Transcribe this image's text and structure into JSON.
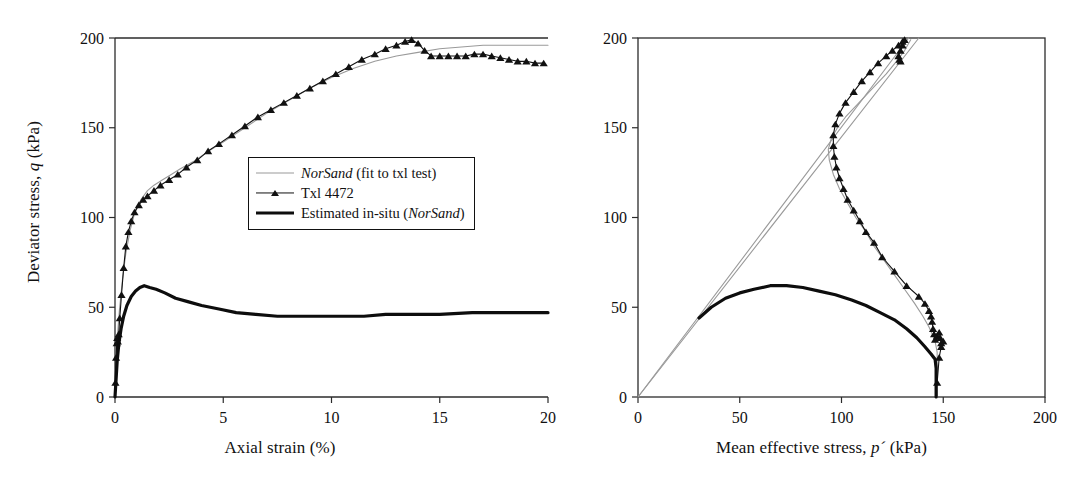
{
  "figure": {
    "panels": [
      {
        "id": "left",
        "ylabel_main": "Deviator stress,",
        "ylabel_sym": "q",
        "ylabel_unit": "(kPa)",
        "xlabel": "Axial strain (%)"
      },
      {
        "id": "right",
        "xlabel_main": "Mean effective stress,",
        "xlabel_sym": "p´",
        "xlabel_unit": "(kPa)"
      }
    ]
  },
  "legend": {
    "position": "center-right of left panel",
    "items": [
      {
        "label": "NorSand (fit to txl test)",
        "emph": "NorSand",
        "rest": " (fit to txl test)",
        "style": "thin-grey-line",
        "color": "#9a9a9a"
      },
      {
        "label": "Txl 4472",
        "emph": "",
        "rest": "Txl 4472",
        "style": "line-with-triangle-markers",
        "color": "#111111"
      },
      {
        "label": "Estimated in-situ (NorSand)",
        "emph": "",
        "rest": "Estimated in-situ (",
        "emph2": "NorSand",
        "rest2": ")",
        "style": "thick-black-line",
        "color": "#0d0d0d"
      }
    ]
  },
  "chart_data": [
    {
      "type": "line",
      "id": "stress-strain",
      "title": "",
      "xlabel": "Axial strain (%)",
      "ylabel": "Deviator stress, q (kPa)",
      "xlim": [
        0,
        20
      ],
      "ylim": [
        0,
        200
      ],
      "xticks": [
        0,
        5,
        10,
        15,
        20
      ],
      "yticks": [
        0,
        50,
        100,
        150,
        200
      ],
      "grid": false,
      "legend_position": "inside-center-right",
      "series": [
        {
          "name": "NorSand (fit to txl test)",
          "style": "thin-grey-line",
          "color": "#9a9a9a",
          "points": [
            [
              0.0,
              0
            ],
            [
              0.05,
              18
            ],
            [
              0.1,
              32
            ],
            [
              0.2,
              48
            ],
            [
              0.35,
              66
            ],
            [
              0.5,
              80
            ],
            [
              0.7,
              93
            ],
            [
              0.9,
              102
            ],
            [
              1.2,
              110
            ],
            [
              1.5,
              115
            ],
            [
              1.8,
              118
            ],
            [
              2.2,
              121
            ],
            [
              2.6,
              124
            ],
            [
              3.0,
              127
            ],
            [
              3.6,
              131
            ],
            [
              4.2,
              136
            ],
            [
              5.0,
              142
            ],
            [
              6.0,
              150
            ],
            [
              7.0,
              158
            ],
            [
              8.0,
              165
            ],
            [
              9.0,
              172
            ],
            [
              10.0,
              178
            ],
            [
              11.0,
              183
            ],
            [
              12.0,
              187
            ],
            [
              13.0,
              190
            ],
            [
              14.0,
              192
            ],
            [
              15.0,
              194
            ],
            [
              16.0,
              195
            ],
            [
              17.0,
              196
            ],
            [
              18.0,
              196
            ],
            [
              19.0,
              196
            ],
            [
              20.0,
              196
            ]
          ]
        },
        {
          "name": "Txl 4472",
          "style": "line-with-triangle-markers",
          "color": "#111111",
          "points": [
            [
              0.02,
              8
            ],
            [
              0.05,
              22
            ],
            [
              0.08,
              30
            ],
            [
              0.1,
              33
            ],
            [
              0.13,
              31
            ],
            [
              0.17,
              35
            ],
            [
              0.22,
              44
            ],
            [
              0.3,
              57
            ],
            [
              0.4,
              72
            ],
            [
              0.5,
              84
            ],
            [
              0.62,
              92
            ],
            [
              0.75,
              98
            ],
            [
              0.9,
              103
            ],
            [
              1.1,
              107
            ],
            [
              1.3,
              110
            ],
            [
              1.5,
              112
            ],
            [
              1.8,
              115
            ],
            [
              2.1,
              118
            ],
            [
              2.5,
              121
            ],
            [
              2.9,
              124
            ],
            [
              3.3,
              128
            ],
            [
              3.8,
              132
            ],
            [
              4.3,
              137
            ],
            [
              4.8,
              141
            ],
            [
              5.4,
              146
            ],
            [
              6.0,
              151
            ],
            [
              6.6,
              156
            ],
            [
              7.2,
              160
            ],
            [
              7.8,
              164
            ],
            [
              8.4,
              168
            ],
            [
              9.0,
              172
            ],
            [
              9.6,
              176
            ],
            [
              10.2,
              180
            ],
            [
              10.8,
              184
            ],
            [
              11.4,
              188
            ],
            [
              12.0,
              191
            ],
            [
              12.5,
              194
            ],
            [
              13.0,
              196
            ],
            [
              13.4,
              198
            ],
            [
              13.7,
              199
            ],
            [
              14.0,
              197
            ],
            [
              14.3,
              193
            ],
            [
              14.6,
              190
            ],
            [
              15.0,
              190
            ],
            [
              15.4,
              190
            ],
            [
              15.8,
              190
            ],
            [
              16.2,
              190
            ],
            [
              16.6,
              191
            ],
            [
              17.0,
              191
            ],
            [
              17.4,
              190
            ],
            [
              17.8,
              189
            ],
            [
              18.2,
              188
            ],
            [
              18.6,
              187
            ],
            [
              19.0,
              187
            ],
            [
              19.4,
              186
            ],
            [
              19.8,
              186
            ]
          ]
        },
        {
          "name": "Estimated in-situ (NorSand)",
          "style": "thick-black-line",
          "color": "#0d0d0d",
          "points": [
            [
              0.0,
              0
            ],
            [
              0.05,
              10
            ],
            [
              0.1,
              20
            ],
            [
              0.18,
              30
            ],
            [
              0.28,
              38
            ],
            [
              0.4,
              45
            ],
            [
              0.55,
              51
            ],
            [
              0.75,
              56
            ],
            [
              0.95,
              59
            ],
            [
              1.15,
              61
            ],
            [
              1.35,
              62
            ],
            [
              1.6,
              61
            ],
            [
              1.9,
              60
            ],
            [
              2.3,
              58
            ],
            [
              2.8,
              55
            ],
            [
              3.4,
              53
            ],
            [
              4.0,
              51
            ],
            [
              4.8,
              49
            ],
            [
              5.6,
              47
            ],
            [
              6.5,
              46
            ],
            [
              7.5,
              45
            ],
            [
              8.5,
              45
            ],
            [
              9.5,
              45
            ],
            [
              10.5,
              45
            ],
            [
              11.5,
              45
            ],
            [
              12.5,
              46
            ],
            [
              13.5,
              46
            ],
            [
              15.0,
              46
            ],
            [
              16.5,
              47
            ],
            [
              18.0,
              47
            ],
            [
              19.5,
              47
            ],
            [
              20.0,
              47
            ]
          ]
        }
      ]
    },
    {
      "type": "line",
      "id": "stress-path",
      "title": "",
      "xlabel": "Mean effective stress, p´ (kPa)",
      "ylabel": "Deviator stress, q (kPa)",
      "xlim": [
        0,
        200
      ],
      "ylim": [
        0,
        200
      ],
      "xticks": [
        0,
        50,
        100,
        150,
        200
      ],
      "yticks": [
        0,
        50,
        100,
        150,
        200
      ],
      "grid": false,
      "legend_position": "none",
      "series": [
        {
          "name": "Critical state line A",
          "style": "thin-grey-line",
          "color": "#9a9a9a",
          "points": [
            [
              0,
              0
            ],
            [
              138,
              200
            ]
          ]
        },
        {
          "name": "Critical state line B",
          "style": "thin-grey-line",
          "color": "#9a9a9a",
          "points": [
            [
              0,
              0
            ],
            [
              133,
              200
            ]
          ]
        },
        {
          "name": "NorSand (fit to txl test)",
          "style": "thin-grey-line",
          "color": "#9a9a9a",
          "points": [
            [
              147,
              0
            ],
            [
              147,
              18
            ],
            [
              147,
              25
            ],
            [
              146.5,
              28
            ],
            [
              146,
              31
            ],
            [
              145,
              34
            ],
            [
              143,
              39
            ],
            [
              140,
              45
            ],
            [
              136,
              52
            ],
            [
              131,
              60
            ],
            [
              126,
              68
            ],
            [
              121,
              76
            ],
            [
              116,
              84
            ],
            [
              112,
              92
            ],
            [
              107,
              100
            ],
            [
              103,
              108
            ],
            [
              99,
              116
            ],
            [
              96,
              124
            ],
            [
              94,
              132
            ],
            [
              93.5,
              138
            ],
            [
              95,
              144
            ],
            [
              98,
              150
            ],
            [
              102,
              156
            ],
            [
              107,
              162
            ],
            [
              112,
              168
            ],
            [
              117,
              174
            ],
            [
              122,
              180
            ],
            [
              127,
              187
            ],
            [
              131,
              193
            ],
            [
              134,
              199
            ]
          ]
        },
        {
          "name": "Txl 4472",
          "style": "line-with-triangle-markers",
          "color": "#111111",
          "points": [
            [
              147,
              8
            ],
            [
              148,
              22
            ],
            [
              149,
              28
            ],
            [
              150,
              31
            ],
            [
              149,
              30
            ],
            [
              148.5,
              33
            ],
            [
              148,
              36
            ],
            [
              147,
              34
            ],
            [
              146,
              32
            ],
            [
              145.5,
              35
            ],
            [
              145,
              38
            ],
            [
              144.5,
              42
            ],
            [
              144,
              45
            ],
            [
              143,
              48
            ],
            [
              141,
              52
            ],
            [
              138,
              56
            ],
            [
              132,
              62
            ],
            [
              126,
              70
            ],
            [
              120,
              78
            ],
            [
              116,
              86
            ],
            [
              112,
              92
            ],
            [
              109,
              98
            ],
            [
              106,
              104
            ],
            [
              103,
              110
            ],
            [
              101,
              116
            ],
            [
              99,
              122
            ],
            [
              97.5,
              128
            ],
            [
              96.5,
              134
            ],
            [
              96,
              140
            ],
            [
              96,
              146
            ],
            [
              97,
              152
            ],
            [
              99,
              158
            ],
            [
              102,
              164
            ],
            [
              106,
              170
            ],
            [
              110,
              176
            ],
            [
              114,
              181
            ],
            [
              118,
              186
            ],
            [
              122,
              190
            ],
            [
              125,
              193
            ],
            [
              128,
              196
            ],
            [
              130,
              198
            ],
            [
              131,
              199
            ],
            [
              130,
              196
            ],
            [
              129,
              193
            ],
            [
              128,
              190
            ],
            [
              128.5,
              188
            ],
            [
              129,
              187
            ]
          ]
        },
        {
          "name": "Estimated in-situ (NorSand)",
          "style": "thick-black-line",
          "color": "#0d0d0d",
          "points": [
            [
              30,
              44
            ],
            [
              36,
              50
            ],
            [
              43,
              55
            ],
            [
              50,
              58
            ],
            [
              57,
              60
            ],
            [
              65,
              62
            ],
            [
              73,
              62
            ],
            [
              81,
              61
            ],
            [
              89,
              59
            ],
            [
              97,
              57
            ],
            [
              105,
              54
            ],
            [
              112,
              51
            ],
            [
              119,
              47
            ],
            [
              126,
              43
            ],
            [
              132,
              38
            ],
            [
              137,
              33
            ],
            [
              141,
              28
            ],
            [
              144,
              24
            ],
            [
              146,
              21
            ],
            [
              146.5,
              16
            ],
            [
              146.5,
              10
            ],
            [
              146.5,
              4
            ],
            [
              146.5,
              0
            ]
          ]
        }
      ]
    }
  ]
}
